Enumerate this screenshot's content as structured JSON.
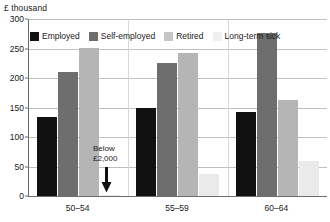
{
  "chart_data": {
    "type": "bar",
    "title": "",
    "subtitle": "",
    "xlabel": "",
    "ylabel": "£ thousand",
    "y_unit_caption": "£ thousand",
    "categories": [
      "50–54",
      "55–59",
      "60–64"
    ],
    "series": [
      {
        "name": "Employed",
        "color": "#111111",
        "values": [
          134,
          150,
          142
        ]
      },
      {
        "name": "Self-employed",
        "color": "#6e6e6e",
        "values": [
          211,
          225,
          276
        ]
      },
      {
        "name": "Retired",
        "color": "#b5b5b5",
        "values": [
          251,
          243,
          163
        ]
      },
      {
        "name": "Long-term sick",
        "color": "#eaeaea",
        "values": [
          2,
          37,
          60
        ]
      }
    ],
    "ylim": [
      0,
      300
    ],
    "yticks": [
      300,
      250,
      200,
      150,
      100,
      50,
      0
    ],
    "ytick_labels": [
      "300",
      "250",
      "200",
      "150",
      "100",
      "50",
      "0"
    ],
    "grid": true,
    "legend_position": "top-left-inside",
    "annotations": [
      {
        "name": "below-2000-callout",
        "line1": "Below",
        "line2": "£2,000",
        "target_series": "Long-term sick",
        "target_category": "50–54",
        "arrow": "down"
      }
    ]
  },
  "legend": {
    "items": [
      {
        "label": "Employed",
        "swatch": "employed"
      },
      {
        "label": "Self-employed",
        "swatch": "self-employed"
      },
      {
        "label": "Retired",
        "swatch": "retired"
      },
      {
        "label": "Long-term sick",
        "swatch": "longterm-sick"
      }
    ]
  },
  "colors": {
    "employed": "#111111",
    "self_employed": "#6e6e6e",
    "retired": "#b5b5b5",
    "longterm_sick": "#eaeaea",
    "axis": "#6b6b6b",
    "gridline": "#bfbfbf",
    "background": "#ffffff"
  }
}
